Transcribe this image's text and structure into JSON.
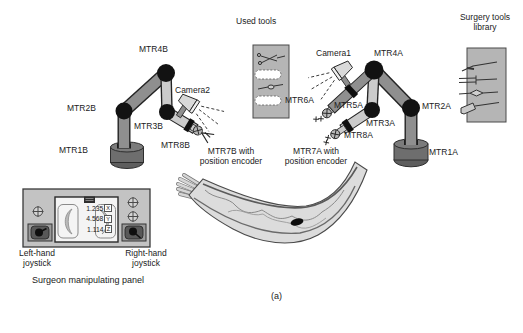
{
  "figure_label": "(a)",
  "used_tools_panel": {
    "title": "Used tools"
  },
  "library_panel": {
    "title": "Surgery tools\nlibrary"
  },
  "arm_b": {
    "mtr1": "MTR1B",
    "mtr2": "MTR2B",
    "mtr3": "MTR3B",
    "mtr4": "MTR4B",
    "mtr8": "MTR8B",
    "camera": "Camera2",
    "mtr7": "MTR7B with\nposition encoder"
  },
  "arm_a": {
    "mtr1": "MTR1A",
    "mtr2": "MTR2A",
    "mtr3": "MTR3A",
    "mtr4": "MTR4A",
    "mtr5": "MTR5A",
    "mtr6": "MTR6A",
    "mtr8": "MTR8A",
    "camera": "Camera1",
    "mtr7": "MTR7A with\nposition encoder"
  },
  "control_panel": {
    "readout": [
      {
        "value": "1.235",
        "axis": "X"
      },
      {
        "value": "4.568",
        "axis": "Y"
      },
      {
        "value": "1.114",
        "axis": "Z"
      }
    ],
    "left_joystick": "Left-hand\njoystick",
    "right_joystick": "Right-hand\njoystick",
    "caption": "Surgeon manipulating panel"
  },
  "colors": {
    "link_dark": "#8f8f8f",
    "link_light": "#cbcbcb",
    "joint_black": "#121212",
    "base_gray": "#6e6e6e",
    "tool_panel_gray": "#b5b5b5",
    "console_gray": "#c3c3c3",
    "limb_fill": "#dcdcdc"
  }
}
